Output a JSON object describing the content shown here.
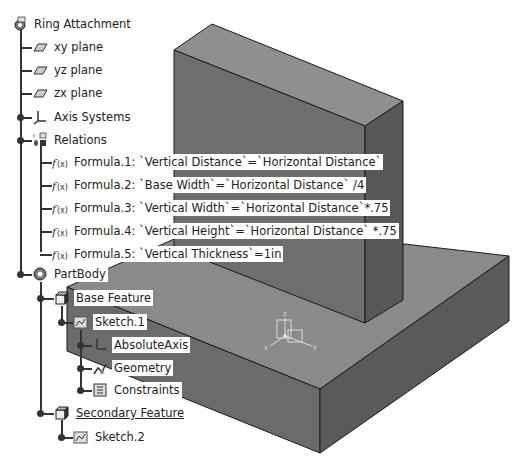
{
  "tree": {
    "root": {
      "label": "Ring Attachment",
      "icon": "part-gear-icon"
    },
    "planes": [
      {
        "label": "xy plane",
        "icon": "plane-icon"
      },
      {
        "label": "yz plane",
        "icon": "plane-icon"
      },
      {
        "label": "zx plane",
        "icon": "plane-icon"
      }
    ],
    "axis_systems": {
      "label": "Axis Systems",
      "icon": "axis-system-icon"
    },
    "relations": {
      "label": "Relations",
      "icon": "relations-icon",
      "formulas": [
        {
          "label": "Formula.1: `Vertical Distance`=`Horizontal Distance`",
          "icon": "formula-icon"
        },
        {
          "label": "Formula.2: `Base Width`=`Horizontal Distance` /4",
          "icon": "formula-icon"
        },
        {
          "label": "Formula.3: `Vertical Width`=`Horizontal Distance`*.75",
          "icon": "formula-icon"
        },
        {
          "label": "Formula.4: `Vertical Height`=`Horizontal Distance` *.75",
          "icon": "formula-icon"
        },
        {
          "label": "Formula.5: `Vertical Thickness`=1in",
          "icon": "formula-icon"
        }
      ]
    },
    "part_body": {
      "label": "PartBody",
      "icon": "body-gear-icon",
      "base_feature": {
        "label": "Base Feature",
        "icon": "pad-icon",
        "sketch": {
          "label": "Sketch.1",
          "icon": "sketch-icon",
          "children": [
            {
              "label": "AbsoluteAxis",
              "icon": "absolute-axis-icon"
            },
            {
              "label": "Geometry",
              "icon": "geometry-icon"
            },
            {
              "label": "Constraints",
              "icon": "constraints-icon"
            }
          ]
        }
      },
      "secondary_feature": {
        "label": "Secondary Feature",
        "icon": "pad-icon",
        "sketch": {
          "label": "Sketch.2",
          "icon": "sketch-icon"
        }
      }
    }
  },
  "model": {
    "colors": {
      "top_face": "#8a8a8a",
      "front_face": "#6e6e6e",
      "side_face": "#5c5c5c",
      "edge": "#1a1a1a",
      "tree_line": "#333333"
    },
    "axis_labels": {
      "x": "x",
      "y": "y",
      "z": "z"
    }
  }
}
